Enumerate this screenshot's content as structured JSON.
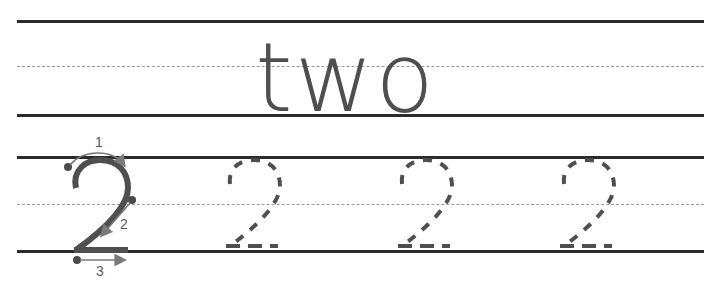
{
  "worksheet": {
    "word": "two",
    "model_digit": "2",
    "stroke_labels": [
      "1",
      "2",
      "3"
    ],
    "trace_digits": [
      "2",
      "2",
      "2"
    ],
    "colors": {
      "line": "#2b2b2b",
      "dashed_guide": "#9a9a9a",
      "digit": "#4f4f4f",
      "arrow": "#7a7a7a",
      "dot": "#4a4a4a"
    }
  }
}
